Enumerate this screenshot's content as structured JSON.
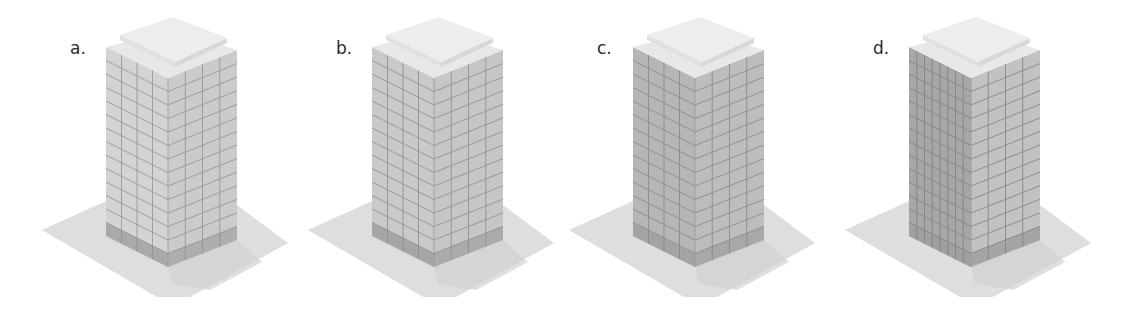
{
  "figure": {
    "panels": [
      {
        "label": "a.",
        "offset_x": 0,
        "left_face": "#d3d3d3",
        "right_face": "#cbcbcb",
        "left_cols": 4,
        "right_cols": 4,
        "floors": 13,
        "grid_line": "#8f8f8f",
        "base_band": "#a9a9a9"
      },
      {
        "label": "b.",
        "offset_x": 266,
        "left_face": "#c9c9c9",
        "right_face": "#c6c6c6",
        "left_cols": 4,
        "right_cols": 4,
        "floors": 13,
        "grid_line": "#8a8a8a",
        "base_band": "#a6a6a6"
      },
      {
        "label": "c.",
        "offset_x": 527,
        "left_face": "#b6b6b6",
        "right_face": "#bdbdbd",
        "left_cols": 4,
        "right_cols": 4,
        "floors": 13,
        "grid_line": "#858585",
        "base_band": "#a4a4a4"
      },
      {
        "label": "d.",
        "offset_x": 803,
        "left_face": "#a7a7a7",
        "right_face": "#c2c2c2",
        "left_cols": 8,
        "right_cols": 4,
        "floors": 13,
        "grid_line": "#7e7e7e",
        "base_band": "#a0a0a0"
      }
    ],
    "colors": {
      "ground": "#dedede",
      "ground_shadow": "#d2d2d2",
      "roof": "#e8e8e8",
      "roof_cap_top": "#ededed",
      "roof_cap_side_left": "#e0e0e0",
      "roof_cap_side_right": "#d8d8d8",
      "label": "#2a2a2a"
    }
  }
}
